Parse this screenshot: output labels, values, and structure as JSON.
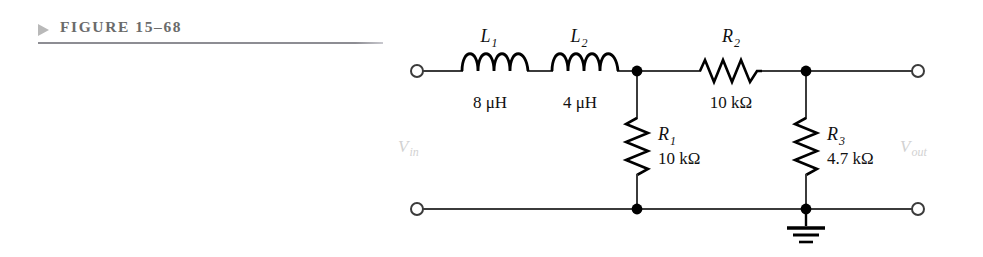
{
  "figure": {
    "marker_icon": "triangle-right-icon",
    "title": "FIGURE 15–68"
  },
  "circuit": {
    "description": "Two-stage low-pass LC/RC filter network",
    "ports": {
      "input_label": "V",
      "input_sub": "in",
      "output_label": "V",
      "output_sub": "out"
    },
    "components": [
      {
        "id": "L1",
        "type": "inductor",
        "ref_label": "L",
        "ref_sub": "1",
        "value": "8 μH",
        "orientation": "horizontal"
      },
      {
        "id": "L2",
        "type": "inductor",
        "ref_label": "L",
        "ref_sub": "2",
        "value": "4 μH",
        "orientation": "horizontal"
      },
      {
        "id": "R2",
        "type": "resistor",
        "ref_label": "R",
        "ref_sub": "2",
        "value": "10 kΩ",
        "orientation": "horizontal"
      },
      {
        "id": "R1",
        "type": "resistor",
        "ref_label": "R",
        "ref_sub": "1",
        "value": "10 kΩ",
        "orientation": "vertical"
      },
      {
        "id": "R3",
        "type": "resistor",
        "ref_label": "R",
        "ref_sub": "3",
        "value": "4.7 kΩ",
        "orientation": "vertical"
      }
    ],
    "ground": {
      "icon": "earth-ground-icon",
      "bars": 3
    },
    "terminals": [
      {
        "name": "input-top-terminal",
        "icon": "open-terminal-icon"
      },
      {
        "name": "input-bottom-terminal",
        "icon": "open-terminal-icon"
      },
      {
        "name": "output-top-terminal",
        "icon": "open-terminal-icon"
      },
      {
        "name": "output-bottom-terminal",
        "icon": "open-terminal-icon"
      }
    ],
    "junctions": [
      {
        "name": "node-a-junction",
        "icon": "junction-dot-icon"
      },
      {
        "name": "node-b-junction",
        "icon": "junction-dot-icon"
      },
      {
        "name": "bottom-left-junction",
        "icon": "junction-dot-icon"
      },
      {
        "name": "bottom-right-junction",
        "icon": "junction-dot-icon"
      }
    ]
  },
  "colors": {
    "wire": "#3b3b3b",
    "component": "#000000",
    "header_text": "#6b6b6b",
    "header_rule": "#8d8d93",
    "marker": "#b9b9b9",
    "port_label": "#d2d2d2"
  }
}
